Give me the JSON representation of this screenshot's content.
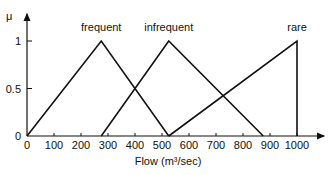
{
  "chart_data": {
    "type": "line",
    "title": "",
    "xlabel": "Flow (m³/sec)",
    "ylabel": "μ",
    "xlim": [
      0,
      1100
    ],
    "ylim": [
      0,
      1.2
    ],
    "grid": false,
    "x_ticks": [
      0,
      100,
      200,
      300,
      400,
      500,
      600,
      700,
      800,
      900,
      1000
    ],
    "y_ticks": [
      0,
      0.5,
      1
    ],
    "y_tick_labels": [
      "0",
      "0.5",
      "1"
    ],
    "series": [
      {
        "name": "frequent",
        "x": [
          0,
          275,
          525
        ],
        "y": [
          0,
          1,
          0
        ]
      },
      {
        "name": "infrequent",
        "x": [
          275,
          525,
          875
        ],
        "y": [
          0,
          1,
          0
        ]
      },
      {
        "name": "rare",
        "x": [
          525,
          1000,
          1000
        ],
        "y": [
          0,
          1,
          0
        ]
      }
    ],
    "annotations": [
      {
        "text": "frequent",
        "x": 275,
        "y": 1.08
      },
      {
        "text": "infrequent",
        "x": 525,
        "y": 1.08
      },
      {
        "text": "rare",
        "x": 1000,
        "y": 1.08
      }
    ],
    "line_color": "#111111"
  }
}
